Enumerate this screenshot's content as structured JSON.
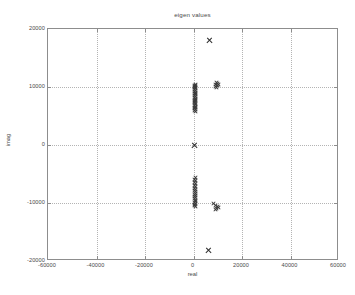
{
  "figure": {
    "width": 355,
    "height": 295,
    "background": "#ffffff",
    "axes_color": "#8d8d8d",
    "grid_color": "#b4b4b4",
    "marker_color": "#3a3a3a",
    "text_color": "#4a4a4a"
  },
  "caption": {
    "text": ""
  },
  "chart_data": {
    "type": "scatter",
    "title": "eigen values",
    "xlabel": "real",
    "ylabel": "imag",
    "xlim": [
      -60000,
      60000
    ],
    "ylim": [
      -20000,
      20000
    ],
    "xticks": [
      -60000,
      -40000,
      -20000,
      0,
      20000,
      40000,
      60000
    ],
    "yticks": [
      -20000,
      -10000,
      0,
      10000,
      20000
    ],
    "xticklabels": [
      "-60000",
      "-40000",
      "-20000",
      "0",
      "20000",
      "40000",
      "60000"
    ],
    "yticklabels": [
      "-20000",
      "-10000",
      "0",
      "10000",
      "20000"
    ],
    "grid": true,
    "grid_style": "dotted",
    "legend": null,
    "marker": "x",
    "series": [
      {
        "name": "eigenvalues",
        "points": [
          [
            6200,
            18000
          ],
          [
            9300,
            10800
          ],
          [
            9700,
            10600
          ],
          [
            8900,
            10500
          ],
          [
            10100,
            10400
          ],
          [
            9500,
            10200
          ],
          [
            8700,
            10050
          ],
          [
            9100,
            9900
          ],
          [
            500,
            10450
          ],
          [
            300,
            10300
          ],
          [
            700,
            10200
          ],
          [
            200,
            10100
          ],
          [
            600,
            10000
          ],
          [
            400,
            9850
          ],
          [
            800,
            9700
          ],
          [
            300,
            9550
          ],
          [
            600,
            9400
          ],
          [
            200,
            9250
          ],
          [
            500,
            9100
          ],
          [
            700,
            8950
          ],
          [
            300,
            8800
          ],
          [
            600,
            8650
          ],
          [
            400,
            8500
          ],
          [
            800,
            8350
          ],
          [
            200,
            8200
          ],
          [
            500,
            8050
          ],
          [
            700,
            7900
          ],
          [
            300,
            7750
          ],
          [
            600,
            7600
          ],
          [
            400,
            7450
          ],
          [
            200,
            7300
          ],
          [
            700,
            7150
          ],
          [
            500,
            7000
          ],
          [
            300,
            6850
          ],
          [
            600,
            6700
          ],
          [
            400,
            6550
          ],
          [
            800,
            6400
          ],
          [
            200,
            6250
          ],
          [
            500,
            6100
          ],
          [
            300,
            5950
          ],
          [
            600,
            5800
          ],
          [
            0,
            0
          ],
          [
            500,
            -5600
          ],
          [
            300,
            -5900
          ],
          [
            700,
            -6100
          ],
          [
            200,
            -6400
          ],
          [
            600,
            -6700
          ],
          [
            400,
            -6950
          ],
          [
            800,
            -7200
          ],
          [
            300,
            -7450
          ],
          [
            600,
            -7700
          ],
          [
            200,
            -7900
          ],
          [
            500,
            -8100
          ],
          [
            700,
            -8300
          ],
          [
            300,
            -8500
          ],
          [
            600,
            -8700
          ],
          [
            400,
            -8900
          ],
          [
            800,
            -9100
          ],
          [
            200,
            -9300
          ],
          [
            500,
            -9500
          ],
          [
            700,
            -9700
          ],
          [
            300,
            -9900
          ],
          [
            600,
            -10100
          ],
          [
            400,
            -10300
          ],
          [
            200,
            -10450
          ],
          [
            500,
            -10600
          ],
          [
            8200,
            -10100
          ],
          [
            9000,
            -10400
          ],
          [
            9600,
            -10600
          ],
          [
            10000,
            -10800
          ],
          [
            9300,
            -10950
          ],
          [
            8700,
            -11100
          ],
          [
            6000,
            -18200
          ]
        ]
      }
    ]
  }
}
